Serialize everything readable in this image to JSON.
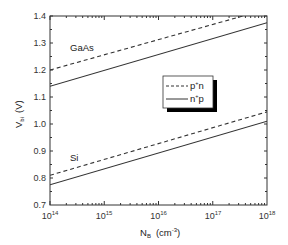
{
  "chart_data": {
    "type": "line",
    "title": "",
    "xlabel": "N_B (cm^-3)",
    "xlabel_main": "N",
    "xlabel_sub": "B",
    "xlabel_unit_pre": "(cm",
    "xlabel_unit_sup": "-3",
    "xlabel_unit_post": ")",
    "ylabel": "V_bi (V)",
    "ylabel_main": "V",
    "ylabel_sub": "bi",
    "ylabel_unit": "(V)",
    "xscale": "log",
    "xlim": [
      100000000000000.0,
      1e+18
    ],
    "ylim": [
      0.7,
      1.4
    ],
    "grid": false,
    "x_ticks": [
      {
        "base": "10",
        "exp": "14"
      },
      {
        "base": "10",
        "exp": "15"
      },
      {
        "base": "10",
        "exp": "16"
      },
      {
        "base": "10",
        "exp": "17"
      },
      {
        "base": "10",
        "exp": "18"
      }
    ],
    "y_ticks": [
      "0.7",
      "0.8",
      "0.9",
      "1.0",
      "1.1",
      "1.2",
      "1.3",
      "1.4"
    ],
    "legend": {
      "position": "center-right",
      "entries": [
        {
          "label_main": "p",
          "label_sup": "+",
          "label_post": "n",
          "style": "dashed"
        },
        {
          "label_main": "n",
          "label_sup": "+",
          "label_post": "p",
          "style": "solid"
        }
      ]
    },
    "annotations": [
      "GaAs",
      "Si"
    ],
    "x": [
      100000000000000.0,
      1e+18
    ],
    "series": [
      {
        "name": "GaAs p+n",
        "style": "dashed",
        "values": [
          1.2,
          1.425
        ]
      },
      {
        "name": "GaAs n+p",
        "style": "solid",
        "values": [
          1.14,
          1.375
        ]
      },
      {
        "name": "Si p+n",
        "style": "dashed",
        "values": [
          0.81,
          1.045
        ]
      },
      {
        "name": "Si n+p",
        "style": "solid",
        "values": [
          0.775,
          1.01
        ]
      }
    ]
  }
}
